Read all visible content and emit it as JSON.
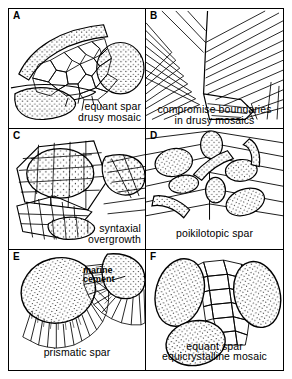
{
  "figure": {
    "type": "line-drawing-plate",
    "panel_count": 6,
    "columns": 2,
    "rows": 3,
    "line_color": "#000000",
    "background_color": "#ffffff"
  },
  "panels": [
    {
      "letter": "A",
      "caption_line1": "equant spar",
      "caption_line2": "drusy mosaic",
      "caption_align": "right",
      "features": [
        "curved stippled shell fragment",
        "drusy polygonal crystal mosaic",
        "stippled ovoid grains"
      ]
    },
    {
      "letter": "B",
      "caption_line1": "compromise boundaries",
      "caption_line2": "in drusy mosaics",
      "caption_align": "center",
      "features": [
        "nested chevron growth bands",
        "suture compromise boundaries"
      ]
    },
    {
      "letter": "C",
      "caption_line1": "syntaxial",
      "caption_line2": "overgrowth",
      "caption_align": "right",
      "features": [
        "stippled ovoid grains",
        "continuous grid overgrowth lines"
      ]
    },
    {
      "letter": "D",
      "caption_line1": "poikilotopic spar",
      "caption_line2": "",
      "caption_align": "center",
      "features": [
        "stippled grains floating in large crystals",
        "curved shell fragments",
        "chevron crystal lines"
      ]
    },
    {
      "letter": "E",
      "caption_line1": "prismatic spar",
      "caption_line2": "",
      "caption_align": "center",
      "annotation": "marine\ncement",
      "annotation_line1": "marine",
      "annotation_line2": "cement",
      "features": [
        "radiating prismatic cement fringe",
        "stippled ovoid grains"
      ]
    },
    {
      "letter": "F",
      "caption_line1": "equant spar",
      "caption_line2": "equicrystalline mosaic",
      "caption_align": "center",
      "features": [
        "three stippled ovoid grains",
        "equant blocky crystal mosaic in pore"
      ]
    }
  ]
}
